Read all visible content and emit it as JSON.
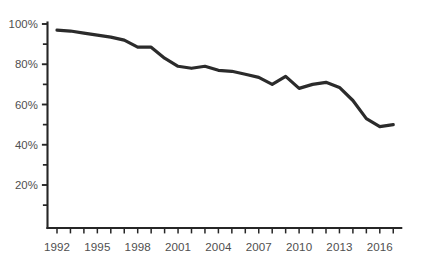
{
  "chart_data": {
    "type": "line",
    "title": "",
    "subtitle": "",
    "xlabel": "",
    "ylabel": "",
    "xlim": [
      1991.6,
      2017.6
    ],
    "ylim": [
      0,
      100
    ],
    "grid": false,
    "legend": null,
    "y_tick_labels": [
      "100%",
      "80%",
      "60%",
      "40%",
      "20%"
    ],
    "y_tick_values": [
      100,
      80,
      60,
      40,
      20
    ],
    "y_minor_tick_values": [
      90,
      70,
      50,
      30,
      10
    ],
    "x_tick_labels": [
      "1992",
      "1995",
      "1998",
      "2001",
      "2004",
      "2007",
      "2010",
      "2013",
      "2016"
    ],
    "x_tick_values": [
      1992,
      1995,
      1998,
      2001,
      2004,
      2007,
      2010,
      2013,
      2016
    ],
    "x_all_ticks": [
      1992,
      1993,
      1994,
      1995,
      1996,
      1997,
      1998,
      1999,
      2000,
      2001,
      2002,
      2003,
      2004,
      2005,
      2006,
      2007,
      2008,
      2009,
      2010,
      2011,
      2012,
      2013,
      2014,
      2015,
      2016,
      2017
    ],
    "series": [
      {
        "name": "percentage",
        "color": "#2b2b2b",
        "x": [
          1992,
          1993,
          1994,
          1995,
          1996,
          1997,
          1998,
          1999,
          2000,
          2001,
          2002,
          2003,
          2004,
          2005,
          2006,
          2007,
          2008,
          2009,
          2010,
          2011,
          2012,
          2013,
          2014,
          2015,
          2016,
          2017
        ],
        "values": [
          97,
          96.5,
          95.5,
          94.5,
          93.5,
          92,
          88.5,
          88.5,
          83,
          79,
          78,
          79,
          77,
          76.5,
          75,
          73.5,
          70,
          74,
          68,
          70,
          71,
          68.5,
          62,
          53,
          49,
          50
        ]
      }
    ]
  },
  "axes": {
    "axis_color": "#262626",
    "label_color": "#4f4f4f"
  },
  "canvas": {
    "background": "#ffffff"
  }
}
